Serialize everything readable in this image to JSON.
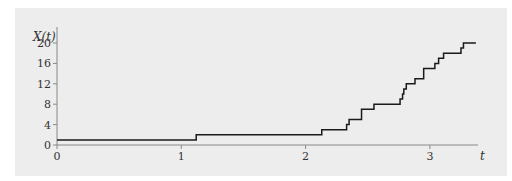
{
  "chart_data": {
    "type": "line",
    "subtype": "step",
    "title": "",
    "xlabel": "t",
    "ylabel": "X(t)",
    "xlim": [
      0,
      3.4
    ],
    "ylim": [
      0,
      21
    ],
    "xticks": [
      0,
      1,
      2,
      3
    ],
    "yticks": [
      0,
      4,
      8,
      12,
      16,
      20
    ],
    "xtick_labels": [
      "0",
      "1",
      "2",
      "3"
    ],
    "ytick_labels": [
      "0",
      "4",
      "8",
      "12",
      "16",
      "20"
    ],
    "grid": false,
    "legend": null,
    "series": [
      {
        "name": "X(t)",
        "color": "#1a1a1a",
        "x": [
          0,
          1.12,
          2.13,
          2.33,
          2.35,
          2.45,
          2.55,
          2.76,
          2.78,
          2.79,
          2.81,
          2.88,
          2.95,
          3.04,
          3.07,
          3.11,
          3.25,
          3.27,
          3.37
        ],
        "values": [
          1,
          2,
          3,
          4,
          5,
          7,
          8,
          9,
          10,
          11,
          12,
          13,
          15,
          16,
          17,
          18,
          19,
          20,
          20
        ]
      }
    ]
  },
  "colors": {
    "background": "#ededed",
    "axis": "#888888",
    "line": "#1a1a1a"
  }
}
